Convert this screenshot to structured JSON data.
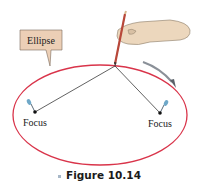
{
  "figure": {
    "label": "Ellipse",
    "foci": [
      {
        "label": "Focus",
        "x": 35,
        "y": 112
      },
      {
        "label": "Focus",
        "x": 160,
        "y": 113
      }
    ],
    "caption": "Figure 10.14",
    "colors": {
      "ellipse": "#d9344a",
      "label_box": "#eccfb6",
      "string": "#3a3a3a",
      "arrow": "#8a9098",
      "pin": "#6fa8c8"
    }
  }
}
